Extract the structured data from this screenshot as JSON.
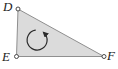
{
  "figure": {
    "type": "geometry-diagram",
    "shape": "right triangle",
    "vertex_labels": {
      "top_left": "D",
      "bottom_left": "E",
      "bottom_right": "F"
    },
    "rotation_arrow": {
      "direction": "counterclockwise",
      "color": "#2b2b2b"
    },
    "colors": {
      "triangle_fill": "#dbdbdb",
      "triangle_edge": "#8f8f8f",
      "vertex_point_fill": "#ffffff",
      "vertex_point_stroke": "#4a4a4a",
      "label_color": "#1c1c1c",
      "background": "#ffffff"
    }
  }
}
